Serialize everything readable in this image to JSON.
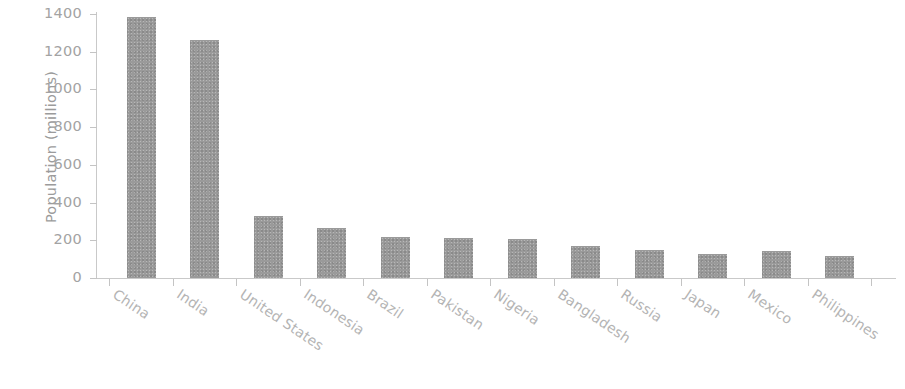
{
  "chart_data": {
    "type": "bar",
    "title": "",
    "xlabel": "",
    "ylabel": "Population (millions)",
    "categories": [
      "China",
      "India",
      "United States",
      "Indonesia",
      "Brazil",
      "Pakistan",
      "Nigeria",
      "Bangladesh",
      "Russia",
      "Japan",
      "Mexico",
      "Philippines"
    ],
    "values": [
      1384,
      1262,
      328,
      265,
      215,
      210,
      205,
      172,
      146,
      126,
      141,
      117
    ],
    "ylim": [
      0,
      1400
    ],
    "ytick_labels": [
      "0",
      "200",
      "400",
      "600",
      "800",
      "1000",
      "1200",
      "1400"
    ],
    "ytick_values": [
      0,
      200,
      400,
      600,
      800,
      1000,
      1200,
      1400
    ],
    "grid": false,
    "legend": "none",
    "bar_color": "#8d8d8d",
    "axis_color": "#c4c4c4",
    "text_color": "#a8a8a8"
  }
}
